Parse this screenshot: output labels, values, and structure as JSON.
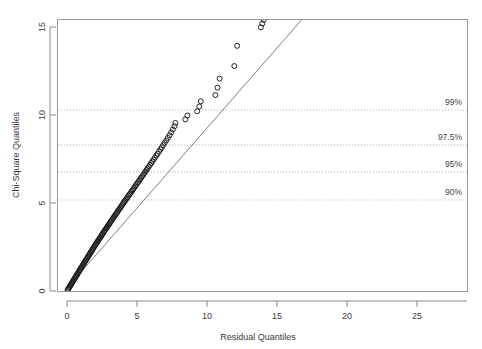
{
  "chart_data": {
    "type": "scatter",
    "title": "",
    "xlabel": "Residual Quantiles",
    "ylabel": "Chi-Square Quantiles",
    "xlim": [
      -1.2,
      28.8
    ],
    "ylim": [
      -0.55,
      15.55
    ],
    "xticks": [
      0,
      5,
      10,
      15,
      20,
      25
    ],
    "xticklabels": [
      "0",
      "5",
      "10",
      "15",
      "20",
      "25"
    ],
    "yticks": [
      0,
      5,
      10,
      15
    ],
    "yticklabels": [
      "0",
      "5",
      "10",
      "15"
    ],
    "grid": "horizontal-dotted",
    "legend": "none",
    "point_marker": "open-circle",
    "point_color": "#1a1a1a",
    "line_color": "#6b6b6b",
    "grid_color": "#b5b5b5",
    "axis_color": "#8a8a8a",
    "reference_line": {
      "label": "reference-line",
      "x0": 0.0,
      "y0": 0.0,
      "x1": 17.1,
      "y1": 15.55,
      "slope": 1.3,
      "intercept": 0.0
    },
    "annotations": [
      {
        "label": "99%",
        "y": 11.34,
        "x_text": 27.4
      },
      {
        "label": "97.5%",
        "y": 9.35,
        "x_text": 27.4
      },
      {
        "label": "95%",
        "y": 7.81,
        "x_text": 27.4
      },
      {
        "label": "90%",
        "y": 6.25,
        "x_text": 27.4
      }
    ],
    "annotation_gridlines": [
      11.34,
      9.35,
      7.81,
      6.25
    ],
    "x": [
      0.05,
      0.09,
      0.14,
      0.18,
      0.22,
      0.27,
      0.31,
      0.35,
      0.4,
      0.44,
      0.48,
      0.53,
      0.57,
      0.62,
      0.66,
      0.7,
      0.75,
      0.79,
      0.84,
      0.88,
      0.93,
      0.97,
      1.02,
      1.06,
      1.11,
      1.15,
      1.2,
      1.24,
      1.29,
      1.33,
      1.38,
      1.42,
      1.47,
      1.52,
      1.56,
      1.61,
      1.66,
      1.7,
      1.75,
      1.8,
      1.84,
      1.89,
      1.94,
      1.99,
      2.03,
      2.08,
      2.13,
      2.18,
      2.23,
      2.28,
      2.33,
      2.38,
      2.43,
      2.48,
      2.53,
      2.58,
      2.63,
      2.68,
      2.73,
      2.79,
      2.84,
      2.89,
      2.94,
      3.0,
      3.05,
      3.1,
      3.16,
      3.21,
      3.27,
      3.32,
      3.38,
      3.43,
      3.49,
      3.55,
      3.6,
      3.66,
      3.72,
      3.78,
      3.84,
      3.9,
      3.96,
      4.02,
      4.08,
      4.14,
      4.2,
      4.27,
      4.33,
      4.39,
      4.46,
      4.52,
      4.59,
      4.66,
      4.72,
      4.79,
      4.86,
      4.93,
      5.0,
      5.07,
      5.15,
      5.22,
      5.29,
      5.37,
      5.45,
      5.52,
      5.6,
      5.68,
      5.76,
      5.85,
      5.93,
      6.02,
      6.1,
      6.19,
      6.28,
      6.38,
      6.47,
      6.57,
      6.67,
      6.77,
      6.87,
      6.98,
      7.09,
      7.2,
      7.32,
      7.44,
      7.56,
      7.68,
      7.74,
      8.45,
      8.6,
      9.3,
      9.45,
      9.55,
      10.6,
      10.75,
      10.9,
      11.95,
      12.15,
      13.85,
      13.95,
      14.05,
      14.95,
      15.45,
      17.45,
      27.35
    ],
    "y": [
      0.07,
      0.12,
      0.18,
      0.23,
      0.29,
      0.35,
      0.4,
      0.46,
      0.52,
      0.57,
      0.63,
      0.69,
      0.74,
      0.8,
      0.86,
      0.91,
      0.97,
      1.03,
      1.09,
      1.15,
      1.21,
      1.26,
      1.32,
      1.38,
      1.44,
      1.5,
      1.56,
      1.62,
      1.68,
      1.73,
      1.79,
      1.85,
      1.91,
      1.97,
      2.03,
      2.09,
      2.15,
      2.21,
      2.27,
      2.33,
      2.39,
      2.45,
      2.51,
      2.57,
      2.63,
      2.69,
      2.75,
      2.81,
      2.87,
      2.93,
      2.99,
      3.05,
      3.11,
      3.17,
      3.23,
      3.29,
      3.36,
      3.42,
      3.48,
      3.54,
      3.6,
      3.66,
      3.73,
      3.79,
      3.85,
      3.92,
      3.98,
      4.04,
      4.11,
      4.17,
      4.24,
      4.3,
      4.37,
      4.43,
      4.5,
      4.57,
      4.63,
      4.7,
      4.77,
      4.84,
      4.91,
      4.98,
      5.05,
      5.12,
      5.19,
      5.26,
      5.33,
      5.41,
      5.48,
      5.55,
      5.63,
      5.71,
      5.78,
      5.86,
      5.94,
      6.02,
      6.1,
      6.18,
      6.26,
      6.35,
      6.43,
      6.52,
      6.61,
      6.7,
      6.79,
      6.88,
      6.97,
      7.07,
      7.17,
      7.27,
      7.37,
      7.47,
      7.58,
      7.69,
      7.8,
      7.92,
      8.04,
      8.16,
      8.29,
      8.42,
      8.56,
      8.7,
      8.85,
      9.01,
      9.18,
      9.36,
      9.55,
      9.75,
      9.97,
      10.21,
      10.48,
      10.78,
      11.13,
      11.55,
      12.07,
      12.78,
      13.93,
      14.98,
      15.2,
      15.4,
      15.6,
      15.8,
      16.0,
      16.2
    ],
    "points_overlay_note": "dense lower cluster plotted as overlapping open circles along the reference line"
  },
  "axes": {
    "x_title": "Residual Quantiles",
    "y_title": "Chi-Square Quantiles"
  },
  "pct_labels": {
    "p99": "99%",
    "p975": "97.5%",
    "p95": "95%",
    "p90": "90%"
  },
  "xtick_labels": {
    "t0": "0",
    "t1": "5",
    "t2": "10",
    "t3": "15",
    "t4": "20",
    "t5": "25"
  },
  "ytick_labels": {
    "t0": "0",
    "t1": "5",
    "t2": "10",
    "t3": "15"
  }
}
